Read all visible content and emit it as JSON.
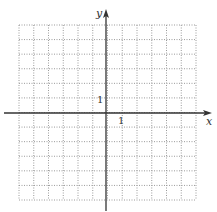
{
  "figure": {
    "type": "coordinate-grid",
    "grid": {
      "columns": 12,
      "rows": 12,
      "x_min": -6,
      "x_max": 6,
      "y_min": -6,
      "y_max": 6,
      "line_style": "dotted",
      "line_color": "#9a9a9a"
    },
    "axes": {
      "x_label": "x",
      "y_label": "y",
      "x_tick_label": "1",
      "y_tick_label": "1",
      "color": "#333333"
    }
  }
}
